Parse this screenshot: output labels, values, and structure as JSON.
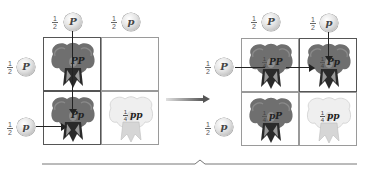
{
  "diagram": {
    "type": "punnett-square-transition",
    "left_square": {
      "column_alleles": [
        {
          "fraction": {
            "num": "1",
            "den": "2"
          },
          "allele": "P"
        },
        {
          "fraction": {
            "num": "1",
            "den": "2"
          },
          "allele": "p"
        }
      ],
      "row_alleles": [
        {
          "fraction": {
            "num": "1",
            "den": "2"
          },
          "allele": "P"
        },
        {
          "fraction": {
            "num": "1",
            "den": "2"
          },
          "allele": "p"
        }
      ],
      "cells": [
        {
          "genotype": "PP",
          "fraction": "",
          "color": "purple",
          "visible": true
        },
        {
          "genotype": "",
          "fraction": "",
          "color": "none",
          "visible": false
        },
        {
          "genotype": "Pp",
          "fraction": "",
          "color": "purple",
          "visible": true
        },
        {
          "genotype": "pp",
          "fraction": {
            "num": "1",
            "den": "4"
          },
          "color": "white",
          "visible": true
        }
      ]
    },
    "right_square": {
      "column_alleles": [
        {
          "fraction": {
            "num": "1",
            "den": "2"
          },
          "allele": "P"
        },
        {
          "fraction": {
            "num": "1",
            "den": "2"
          },
          "allele": "p"
        }
      ],
      "row_alleles": [
        {
          "fraction": {
            "num": "1",
            "den": "2"
          },
          "allele": "P"
        },
        {
          "fraction": {
            "num": "1",
            "den": "2"
          },
          "allele": "p"
        }
      ],
      "cells": [
        {
          "genotype": "PP",
          "fraction": {
            "num": "1",
            "den": "4"
          },
          "color": "purple"
        },
        {
          "genotype": "Pp",
          "fraction": {
            "num": "1",
            "den": "4"
          },
          "color": "purple"
        },
        {
          "genotype": "pP",
          "fraction": {
            "num": "1",
            "den": "4"
          },
          "color": "purple"
        },
        {
          "genotype": "pp",
          "fraction": {
            "num": "1",
            "den": "4"
          },
          "color": "white"
        }
      ]
    },
    "colors": {
      "purple_flower": "#6e6e6e",
      "white_flower": "#e6e6e6",
      "grid_line": "#8a8a8a",
      "arrow": "#222222"
    }
  }
}
